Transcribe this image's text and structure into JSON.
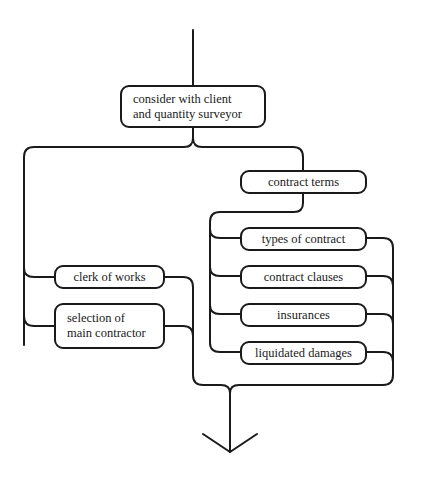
{
  "diagram": {
    "type": "flowchart",
    "line_color": "#1a1a1a",
    "background": "#ffffff",
    "nodes": {
      "consider": {
        "line1": "consider with client",
        "line2": "and quantity surveyor"
      },
      "contract_terms": {
        "label": "contract terms"
      },
      "clerk_of_works": {
        "label": "clerk of works"
      },
      "selection": {
        "line1": "selection of",
        "line2": "main contractor"
      },
      "types_of_contract": {
        "label": "types of contract"
      },
      "contract_clauses": {
        "label": "contract clauses"
      },
      "insurances": {
        "label": "insurances"
      },
      "liquidated_damages": {
        "label": "liquidated damages"
      }
    },
    "edges": [
      {
        "from": "entry",
        "to": "consider"
      },
      {
        "from": "consider",
        "to": "clerk_of_works"
      },
      {
        "from": "consider",
        "to": "selection"
      },
      {
        "from": "consider",
        "to": "contract_terms"
      },
      {
        "from": "contract_terms",
        "to": "types_of_contract"
      },
      {
        "from": "contract_terms",
        "to": "contract_clauses"
      },
      {
        "from": "contract_terms",
        "to": "insurances"
      },
      {
        "from": "contract_terms",
        "to": "liquidated_damages"
      },
      {
        "from": "all",
        "to": "exit-arrow"
      }
    ]
  }
}
